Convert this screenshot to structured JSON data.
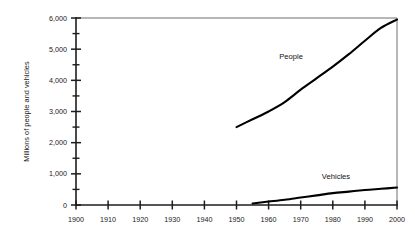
{
  "chart_data": {
    "type": "line",
    "title": "",
    "xlabel": "",
    "ylabel": "Millions of people and vehicles",
    "xlim": [
      1900,
      2000
    ],
    "ylim": [
      0,
      6000
    ],
    "grid": false,
    "legend_position": "inline-annotations",
    "x_ticks": [
      "1900",
      "1910",
      "1920",
      "1930",
      "1940",
      "1950",
      "1960",
      "1970",
      "1980",
      "1990",
      "2000"
    ],
    "x_tick_values": [
      1900,
      1910,
      1920,
      1930,
      1940,
      1950,
      1960,
      1970,
      1980,
      1990,
      2000
    ],
    "y_ticks": [
      "0",
      "1,000",
      "2,000",
      "3,000",
      "4,000",
      "5,000",
      "6,000"
    ],
    "y_tick_values": [
      0,
      1000,
      2000,
      3000,
      4000,
      5000,
      6000
    ],
    "y_minor_tick_values": [
      500,
      1500,
      2500,
      3500,
      4500,
      5500
    ],
    "series": [
      {
        "name": "People",
        "label": "People",
        "color": "#000000",
        "stroke_width": 2.1,
        "label_x": 1967,
        "label_y": 4700,
        "x": [
          1950,
          1955,
          1960,
          1965,
          1970,
          1975,
          1980,
          1985,
          1990,
          1995,
          2000
        ],
        "values": [
          2500,
          2750,
          3000,
          3300,
          3700,
          4070,
          4440,
          4840,
          5270,
          5680,
          5950
        ]
      },
      {
        "name": "Vehicles",
        "label": "Vehicles",
        "color": "#000000",
        "stroke_width": 2.1,
        "label_x": 1981,
        "label_y": 830,
        "x": [
          1955,
          1960,
          1965,
          1970,
          1975,
          1980,
          1985,
          1990,
          1995,
          2000
        ],
        "values": [
          50,
          110,
          170,
          240,
          310,
          380,
          430,
          480,
          520,
          560
        ]
      }
    ]
  },
  "axes": {
    "y_axis_title": "Millions of people and vehicles"
  }
}
